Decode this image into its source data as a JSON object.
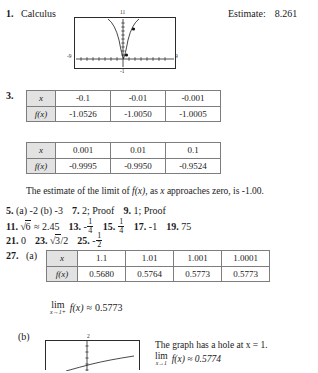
{
  "problem1": {
    "number": "1.",
    "label": "Calculus",
    "estimate_label": "Estimate:",
    "estimate_value": "8.261",
    "graph": {
      "ymax_label": "11",
      "ymin_label": "-1",
      "xmin_label": "-9",
      "xmax_label": "9",
      "description": "parabola-with-two-plotted-points"
    }
  },
  "problem3": {
    "number": "3.",
    "table_negative": {
      "row_labels": [
        "x",
        "f(x)"
      ],
      "x_values": [
        "-0.1",
        "-0.01",
        "-0.001"
      ],
      "fx_values": [
        "-1.0526",
        "-1.0050",
        "-1.0005"
      ]
    },
    "table_positive": {
      "row_labels": [
        "x",
        "f(x)"
      ],
      "x_values": [
        "0.001",
        "0.01",
        "0.1"
      ],
      "fx_values": [
        "-0.9995",
        "-0.9950",
        "-0.9524"
      ]
    },
    "note_part1": "The estimate of the limit of ",
    "note_fx": "f(x)",
    "note_part2": ", as ",
    "note_x": "x",
    "note_part3": " approaches zero, is ",
    "note_value": "-1.00."
  },
  "answers": {
    "line1": {
      "items": [
        {
          "number": "5.",
          "text": "(a) -2   (b) -3"
        },
        {
          "number": "7.",
          "text": "2; Proof"
        },
        {
          "number": "9.",
          "text": "1; Proof"
        }
      ]
    },
    "line2": {
      "n11": "11.",
      "a11_sqrt": "6",
      "a11_approx": "≈ 2.45",
      "n13": "13.",
      "a13_sign": "-",
      "a13_num": "1",
      "a13_den": "4",
      "n15": "15.",
      "a15_num": "1",
      "a15_den": "4",
      "n17": "17.",
      "a17": "-1",
      "n19": "19.",
      "a19": "75"
    },
    "line3": {
      "n21": "21.",
      "a21": "0",
      "n23": "23.",
      "a23_sqrt": "3",
      "a23_tail": "/2",
      "n25": "25.",
      "a25_sign": "-",
      "a25_num": "1",
      "a25_den": "2"
    }
  },
  "problem27": {
    "number": "27.",
    "part_a": "(a)",
    "part_b": "(b)",
    "table": {
      "row_labels": [
        "x",
        "f(x)"
      ],
      "x_values": [
        "1.1",
        "1.01",
        "1.001",
        "1.0001"
      ],
      "fx_values": [
        "0.5680",
        "0.5764",
        "0.5773",
        "0.5773"
      ]
    },
    "limit": {
      "lim": "lim",
      "subscript": "x→1+",
      "function": "f(x)",
      "relation": "≈",
      "value": "0.5773"
    },
    "graph": {
      "ymax_label": "2"
    },
    "note_line1": "The graph has a hole at x = 1.",
    "note_line2_lim": "lim",
    "note_line2_sub": "x→1",
    "note_line2_rest": "f(x) ≈ 0.5774"
  }
}
